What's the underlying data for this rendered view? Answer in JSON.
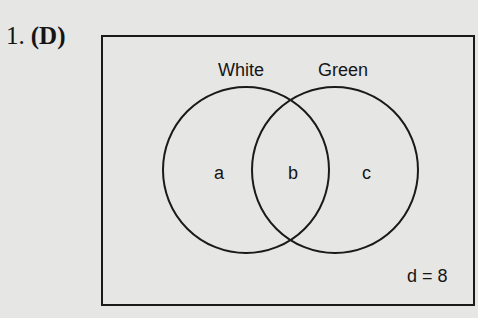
{
  "question": {
    "number": "1.",
    "answer": "(D)"
  },
  "venn": {
    "sets": [
      {
        "name": "White",
        "region_label": "a"
      },
      {
        "name": "Green",
        "region_label": "c"
      }
    ],
    "intersection_label": "b",
    "outside_label": "d = 8",
    "colors": {
      "stroke": "#1a1a1a",
      "background": "#e6e6e4"
    }
  }
}
